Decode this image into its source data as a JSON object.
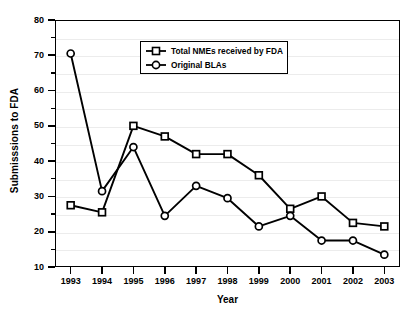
{
  "chart_data": {
    "type": "line",
    "title": "",
    "xlabel": "Year",
    "ylabel": "Submisssions to FDA",
    "categories": [
      "1993",
      "1994",
      "1995",
      "1996",
      "1997",
      "1998",
      "1999",
      "2000",
      "2001",
      "2002",
      "2003"
    ],
    "x": [
      1993,
      1994,
      1995,
      1996,
      1997,
      1998,
      1999,
      2000,
      2001,
      2002,
      2003
    ],
    "series": [
      {
        "name": "Total NMEs received by FDA",
        "marker": "square",
        "color": "#000000",
        "values": [
          27.5,
          25.5,
          50,
          47,
          42,
          42,
          36,
          26.5,
          30,
          22.5,
          21.5
        ]
      },
      {
        "name": "Original BLAs",
        "marker": "circle",
        "color": "#000000",
        "values": [
          70.5,
          31.5,
          44,
          24.5,
          33,
          29.5,
          21.5,
          24.5,
          17.5,
          17.5,
          13.5
        ]
      }
    ],
    "ylim": [
      10,
      80
    ],
    "yticks": [
      10,
      20,
      30,
      40,
      50,
      60,
      70,
      80
    ],
    "ytick_labels": [
      "10",
      "20",
      "30",
      "40",
      "50",
      "60",
      "70",
      "80"
    ],
    "yminor_ticks": [
      15,
      25,
      35,
      45,
      55,
      65,
      75
    ],
    "grid": true,
    "grid_color": "#ececec",
    "legend_position": "upper center",
    "legend_entries": [
      "Total NMEs received by FDA",
      "Original BLAs"
    ],
    "axis_color": "#000000",
    "background": "#ffffff"
  }
}
